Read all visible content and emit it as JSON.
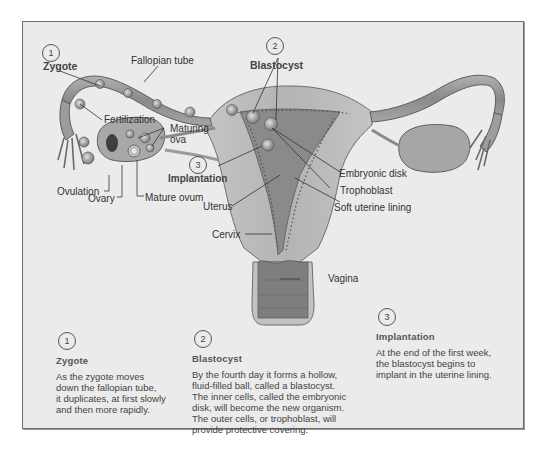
{
  "diagram": {
    "labels": {
      "zygote": "Zygote",
      "fallopian_tube": "Fallopian tube",
      "blastocyst": "Blastocyst",
      "fertilization": "Fertilization",
      "maturing_ova_1": "Maturing",
      "maturing_ova_2": "ova",
      "implantation": "Implantation",
      "ovulation": "Ovulation",
      "ovary": "Ovary",
      "mature_ovum": "Mature ovum",
      "uterus": "Uterus",
      "embryonic_disk": "Embryonic disk",
      "trophoblast": "Trophoblast",
      "soft_uterine_lining": "Soft uterine lining",
      "cervix": "Cervix",
      "vagina": "Vagina"
    },
    "markers": {
      "zygote": "1",
      "blastocyst": "2",
      "implantation": "3"
    }
  },
  "steps": [
    {
      "number": "1",
      "title": "Zygote",
      "body": [
        "As the zygote moves",
        "down the fallopian tube,",
        "it duplicates, at first slowly",
        "and then more rapidly."
      ]
    },
    {
      "number": "2",
      "title": "Blastocyst",
      "body": [
        "By the fourth day it forms a hollow,",
        "fluid-filled ball, called a blastocyst.",
        "The inner cells, called the embryonic",
        "disk, will become the new organism.",
        "The outer cells, or trophoblast, will",
        "provide protective covering."
      ]
    },
    {
      "number": "3",
      "title": "Implantation",
      "body": [
        "At the end of the first week,",
        "the blastocyst begins to",
        "implant in the uterine lining."
      ]
    }
  ],
  "colors": {
    "background": "#ebebeb",
    "frame_border": "#6c6c6c",
    "tissue_light": "#c8c8c8",
    "tissue_mid": "#a8a8a8",
    "tissue_dark": "#6e6e6e",
    "text": "#333333"
  }
}
